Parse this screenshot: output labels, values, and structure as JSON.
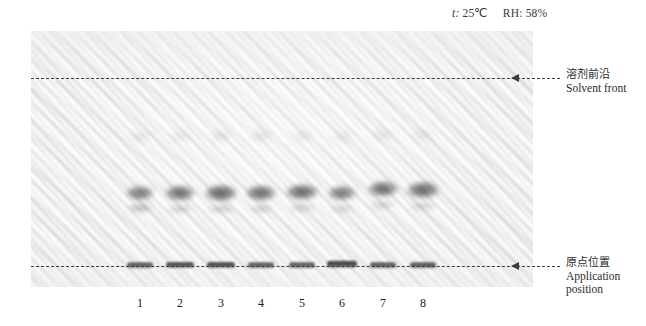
{
  "figure": {
    "type": "tlc-chromatogram-plate",
    "conditions": {
      "temperature_label": "t:",
      "temperature_value": "25℃",
      "humidity_label": "RH:",
      "humidity_value": "58%",
      "full_text": "t: 25℃   RH: 58%"
    },
    "plate": {
      "x": 31,
      "y": 31,
      "width": 502,
      "height": 256,
      "background_color": "#f4f4f4",
      "texture": "diagonal-weave"
    },
    "reference_lines": [
      {
        "id": "solvent-front",
        "y": 78,
        "style": "dashed",
        "color": "#3b3b3b",
        "arrow": "left",
        "label_cn": "溶剂前沿",
        "label_en": "Solvent front"
      },
      {
        "id": "application-position",
        "y": 266,
        "style": "dashed",
        "color": "#3b3b3b",
        "arrow": "left",
        "label_cn": "原点位置",
        "label_en_line1": "Application",
        "label_en_line2": "position"
      }
    ],
    "lanes": [
      {
        "number": "1",
        "x": 140
      },
      {
        "number": "2",
        "x": 180
      },
      {
        "number": "3",
        "x": 221
      },
      {
        "number": "4",
        "x": 261
      },
      {
        "number": "5",
        "x": 302
      },
      {
        "number": "6",
        "x": 342
      },
      {
        "number": "7",
        "x": 383
      },
      {
        "number": "8",
        "x": 423
      }
    ],
    "spots": [
      {
        "lane": 1,
        "cx": 140,
        "cy": 193,
        "rx": 14,
        "ry": 7.5,
        "opacity": 0.62,
        "band": "main"
      },
      {
        "lane": 2,
        "cx": 180,
        "cy": 193,
        "rx": 15,
        "ry": 8.0,
        "opacity": 0.68,
        "band": "main"
      },
      {
        "lane": 3,
        "cx": 221,
        "cy": 193,
        "rx": 16,
        "ry": 8.5,
        "opacity": 0.74,
        "band": "main"
      },
      {
        "lane": 4,
        "cx": 261,
        "cy": 193,
        "rx": 15,
        "ry": 8.0,
        "opacity": 0.7,
        "band": "main"
      },
      {
        "lane": 5,
        "cx": 302,
        "cy": 192,
        "rx": 16,
        "ry": 8.0,
        "opacity": 0.72,
        "band": "main"
      },
      {
        "lane": 6,
        "cx": 342,
        "cy": 193,
        "rx": 14,
        "ry": 7.5,
        "opacity": 0.64,
        "band": "main"
      },
      {
        "lane": 7,
        "cx": 383,
        "cy": 189,
        "rx": 15,
        "ry": 8.0,
        "opacity": 0.7,
        "band": "main"
      },
      {
        "lane": 8,
        "cx": 423,
        "cy": 190,
        "rx": 16,
        "ry": 8.5,
        "opacity": 0.72,
        "band": "main"
      },
      {
        "lane": 1,
        "cx": 140,
        "cy": 208,
        "rx": 12,
        "ry": 4.0,
        "opacity": 0.34,
        "band": "secondary"
      },
      {
        "lane": 2,
        "cx": 180,
        "cy": 209,
        "rx": 12,
        "ry": 3.5,
        "opacity": 0.26,
        "band": "secondary"
      },
      {
        "lane": 3,
        "cx": 221,
        "cy": 209,
        "rx": 13,
        "ry": 3.5,
        "opacity": 0.26,
        "band": "secondary"
      },
      {
        "lane": 4,
        "cx": 261,
        "cy": 209,
        "rx": 12,
        "ry": 3.5,
        "opacity": 0.24,
        "band": "secondary"
      },
      {
        "lane": 5,
        "cx": 302,
        "cy": 208,
        "rx": 13,
        "ry": 3.5,
        "opacity": 0.24,
        "band": "secondary"
      },
      {
        "lane": 6,
        "cx": 342,
        "cy": 209,
        "rx": 12,
        "ry": 3.5,
        "opacity": 0.22,
        "band": "secondary"
      },
      {
        "lane": 7,
        "cx": 383,
        "cy": 205,
        "rx": 12,
        "ry": 3.5,
        "opacity": 0.22,
        "band": "secondary"
      },
      {
        "lane": 8,
        "cx": 423,
        "cy": 206,
        "rx": 13,
        "ry": 3.5,
        "opacity": 0.22,
        "band": "secondary"
      },
      {
        "lane": 1,
        "cx": 140,
        "cy": 137,
        "rx": 10,
        "ry": 4.5,
        "opacity": 0.14,
        "band": "faint-upper"
      },
      {
        "lane": 2,
        "cx": 180,
        "cy": 137,
        "rx": 10,
        "ry": 4.5,
        "opacity": 0.12,
        "band": "faint-upper"
      },
      {
        "lane": 3,
        "cx": 221,
        "cy": 136,
        "rx": 10,
        "ry": 4.5,
        "opacity": 0.16,
        "band": "faint-upper"
      },
      {
        "lane": 4,
        "cx": 261,
        "cy": 136,
        "rx": 10,
        "ry": 4.5,
        "opacity": 0.17,
        "band": "faint-upper"
      },
      {
        "lane": 5,
        "cx": 302,
        "cy": 136,
        "rx": 10,
        "ry": 4.5,
        "opacity": 0.13,
        "band": "faint-upper"
      },
      {
        "lane": 6,
        "cx": 342,
        "cy": 137,
        "rx": 10,
        "ry": 4.5,
        "opacity": 0.11,
        "band": "faint-upper"
      },
      {
        "lane": 7,
        "cx": 383,
        "cy": 135,
        "rx": 10,
        "ry": 4.5,
        "opacity": 0.12,
        "band": "faint-upper"
      },
      {
        "lane": 8,
        "cx": 423,
        "cy": 135,
        "rx": 10,
        "ry": 4.5,
        "opacity": 0.12,
        "band": "faint-upper"
      }
    ],
    "origin_bands": [
      {
        "lane": 1,
        "cx": 140,
        "cy": 265,
        "w": 26,
        "h": 5.5,
        "opacity": 0.7
      },
      {
        "lane": 2,
        "cx": 180,
        "cy": 265,
        "w": 28,
        "h": 6.0,
        "opacity": 0.76
      },
      {
        "lane": 3,
        "cx": 221,
        "cy": 265,
        "w": 28,
        "h": 6.0,
        "opacity": 0.78
      },
      {
        "lane": 4,
        "cx": 261,
        "cy": 265,
        "w": 26,
        "h": 5.5,
        "opacity": 0.7
      },
      {
        "lane": 5,
        "cx": 302,
        "cy": 265,
        "w": 26,
        "h": 5.5,
        "opacity": 0.7
      },
      {
        "lane": 6,
        "cx": 342,
        "cy": 264,
        "w": 30,
        "h": 6.5,
        "opacity": 0.82
      },
      {
        "lane": 7,
        "cx": 383,
        "cy": 265,
        "w": 26,
        "h": 5.5,
        "opacity": 0.72
      },
      {
        "lane": 8,
        "cx": 423,
        "cy": 265,
        "w": 26,
        "h": 5.5,
        "opacity": 0.72
      }
    ]
  }
}
